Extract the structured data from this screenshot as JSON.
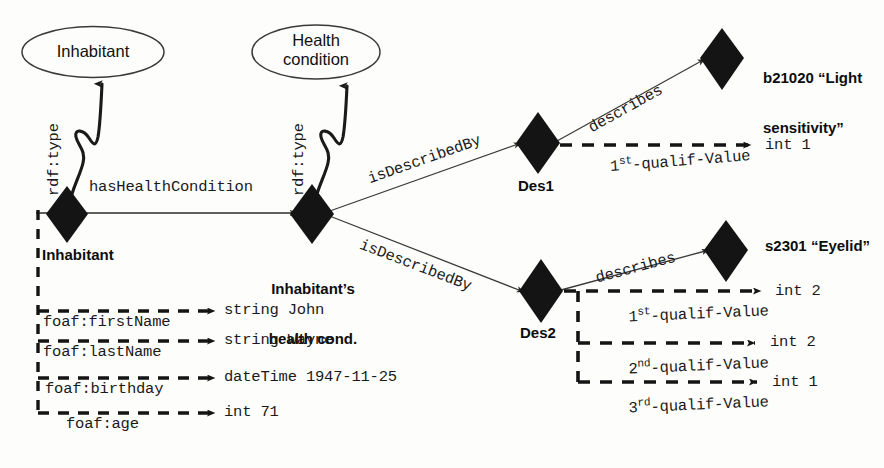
{
  "diagram": {
    "classes": [
      {
        "id": "class-inhabitant",
        "label": "Inhabitant"
      },
      {
        "id": "class-health-condition",
        "label": "Health\ncondition"
      }
    ],
    "class_labels": {
      "inhabitant": "Inhabitant",
      "health_condition_line1": "Health",
      "health_condition_line2": "condition"
    },
    "nodes": [
      {
        "id": "node-inhabitant",
        "label": "Inhabitant"
      },
      {
        "id": "node-health-cond",
        "label_line1": "Inhabitant’s",
        "label_line2": "health cond."
      },
      {
        "id": "node-des1",
        "label": "Des1"
      },
      {
        "id": "node-des2",
        "label": "Des2"
      },
      {
        "id": "node-b21020",
        "label_line1": "b21020 “Light",
        "label_line2": "sensitivity”"
      },
      {
        "id": "node-s2301",
        "label": "s2301 “Eyelid”"
      }
    ],
    "node_labels": {
      "inhabitant": "Inhabitant",
      "health_cond_line1": "Inhabitant’s",
      "health_cond_line2": "health cond.",
      "des1": "Des1",
      "des2": "Des2",
      "b21020_line1": "b21020 “Light",
      "b21020_line2": "sensitivity”",
      "s2301": "s2301 “Eyelid”"
    },
    "edges": {
      "rdf_type_left": "rdf:type",
      "rdf_type_center": "rdf:type",
      "has_health_condition": "hasHealthCondition",
      "is_described_by_1": "isDescribedBy",
      "is_described_by_2": "isDescribedBy",
      "describes_1": "describes",
      "describes_2": "describes",
      "foaf_first_name": "foaf:firstName",
      "foaf_last_name": "foaf:lastName",
      "foaf_birthday": "foaf:birthday",
      "foaf_age": "foaf:age",
      "qualif_1_des1_pre": "1",
      "qualif_1_des1_sup": "st",
      "qualif_1_des1_post": "-qualif-Value",
      "qualif_1_des2_pre": "1",
      "qualif_1_des2_sup": "st",
      "qualif_1_des2_post": "-qualif-Value",
      "qualif_2_des2_pre": "2",
      "qualif_2_des2_sup": "nd",
      "qualif_2_des2_post": "-qualif-Value",
      "qualif_3_des2_pre": "3",
      "qualif_3_des2_sup": "rd",
      "qualif_3_des2_post": "-qualif-Value"
    },
    "literals": {
      "first_name": "string John",
      "last_name": "string Wayne",
      "birthday": "dateTime 1947-11-25",
      "age": "int 71",
      "des1_qualif1": "int 1",
      "des2_qualif1": "int 2",
      "des2_qualif2": "int 2",
      "des2_qualif3": "int 1"
    },
    "colors": {
      "node_fill": "#1a1a1a",
      "stroke": "#2b2b2b",
      "ellipse_stroke": "#3a3a3a",
      "text": "#111111",
      "background": "#fdfdfc"
    }
  }
}
